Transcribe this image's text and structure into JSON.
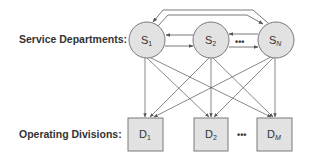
{
  "labels": {
    "service": "Service Departments:",
    "operating": "Operating Divisions:"
  },
  "service_departments": [
    {
      "id": "S1",
      "main": "S",
      "sub": "1",
      "cx": 147,
      "cy": 40
    },
    {
      "id": "S2",
      "main": "S",
      "sub": "2",
      "cx": 211,
      "cy": 40
    },
    {
      "id": "SN",
      "main": "S",
      "sub": "N",
      "cx": 276,
      "cy": 40
    }
  ],
  "operating_divisions": [
    {
      "id": "D1",
      "main": "D",
      "sub": "1",
      "x": 128,
      "y": 118
    },
    {
      "id": "D2",
      "main": "D",
      "sub": "2",
      "x": 194,
      "y": 118
    },
    {
      "id": "DM",
      "main": "D",
      "sub": "M",
      "x": 257,
      "y": 118
    }
  ],
  "ellipsis": "•••",
  "colors": {
    "node_fill": "#e2e2e2",
    "node_stroke": "#7a7a7a",
    "arrow": "#555555",
    "text": "#333333"
  }
}
